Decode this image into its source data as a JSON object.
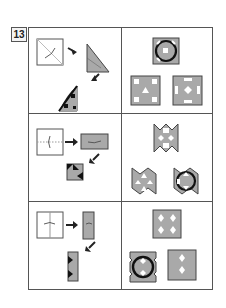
{
  "problem": {
    "number": "13"
  },
  "colors": {
    "border": "#555555",
    "paper_gray": "#a9a9a9",
    "fill_dark": "#222222",
    "background": "#ffffff"
  },
  "rows": [
    {
      "folding": {
        "steps": [
          "square with diagonal fold line and cut mark",
          "folded triangle",
          "triangle with punched holes"
        ]
      },
      "options": [
        "square with ring and central square hole",
        "square with four square holes and triangle",
        "square with rectangles and diamond"
      ]
    },
    {
      "folding": {
        "steps": [
          "square with horizontal fold line",
          "folded rectangle",
          "folded rectangle with triangular cuts"
        ]
      },
      "options": [
        "notched square with diamonds and squares",
        "notched square with triangles",
        "notched square with ring"
      ]
    },
    {
      "folding": {
        "steps": [
          "square with vertical fold line",
          "folded narrow rectangle",
          "narrow rectangle with triangular cuts"
        ]
      },
      "options": [
        "square with four diamonds",
        "notched square with ring",
        "square with two diamonds"
      ]
    }
  ]
}
